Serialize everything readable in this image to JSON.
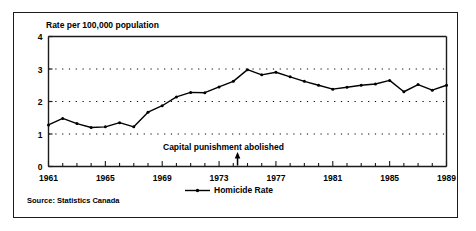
{
  "figure": {
    "axis_title": "Rate per 100,000 population",
    "source_note": "Source: Statistics Canada",
    "annotation": {
      "text": "Capital punishment abolished",
      "year": 1974.3,
      "marker": "up-arrow"
    },
    "legend": {
      "label": "Homicide Rate",
      "marker": "line-with-dot",
      "position": "bottom-center"
    },
    "colors": {
      "line": "#000000",
      "frame": "#1b1b1b",
      "grid": "#000000",
      "background": "#ffffff"
    }
  },
  "chart_data": {
    "type": "line",
    "title": "",
    "subtitle": "",
    "xlabel": "",
    "ylabel": "Rate per 100,000 population",
    "xlim": [
      1961,
      1989
    ],
    "ylim": [
      0,
      4
    ],
    "yticks": [
      0,
      1,
      2,
      3,
      4
    ],
    "ytick_labels": [
      "0",
      "1",
      "2",
      "3",
      "4"
    ],
    "xticks": [
      1961,
      1965,
      1969,
      1973,
      1977,
      1981,
      1985,
      1989
    ],
    "xtick_labels": [
      "1961",
      "1965",
      "1969",
      "1973",
      "1977",
      "1981",
      "1985",
      "1989"
    ],
    "minor_xticks_every": 1,
    "grid": "horizontal-dotted",
    "legend_position": "bottom-center",
    "series": [
      {
        "name": "Homicide Rate",
        "marker": "dot",
        "x": [
          1961,
          1962,
          1963,
          1964,
          1965,
          1966,
          1967,
          1968,
          1969,
          1970,
          1971,
          1972,
          1973,
          1974,
          1975,
          1976,
          1977,
          1978,
          1979,
          1980,
          1981,
          1982,
          1983,
          1984,
          1985,
          1986,
          1987,
          1988,
          1989
        ],
        "values": [
          1.28,
          1.48,
          1.32,
          1.2,
          1.22,
          1.35,
          1.22,
          1.67,
          1.87,
          2.14,
          2.28,
          2.27,
          2.45,
          2.62,
          2.98,
          2.82,
          2.9,
          2.76,
          2.62,
          2.5,
          2.38,
          2.44,
          2.5,
          2.54,
          2.65,
          2.3,
          2.52,
          2.35,
          2.5
        ]
      }
    ]
  }
}
